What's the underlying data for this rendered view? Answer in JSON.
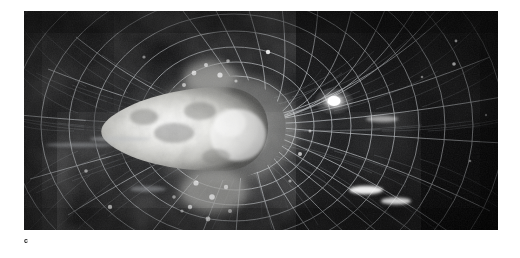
{
  "figure": {
    "panel_label": "c",
    "caption_text": "",
    "kind": "scientific-image"
  },
  "image": {
    "name": "spherical-projection-grid-image",
    "description": "Grayscale wide-field image showing a bright textured central core with radial meridian lines and concentric arc rings forming a spherical tunnel projection over a dark background with bright point sources and elongated streaks.",
    "colors": {
      "page_background": "#ffffff",
      "plate_background": "#050505",
      "plate_deep_black": "#000000",
      "grid_line": "#b9bcc0",
      "grid_line_faint": "#5a5e63",
      "core_bright": "#f2f2ef",
      "core_mid": "#c8c8c4",
      "core_shadow": "#8d8d8a",
      "star_white": "#ffffff",
      "nebula_grey": "#3a3c3e",
      "label_text": "#1a1a1a"
    },
    "geometry": {
      "plate_left": 24,
      "plate_top": 11,
      "plate_width": 474,
      "plate_height": 219,
      "vanishing_point_x": 236,
      "vanishing_point_y": 126,
      "core_center_x": 222,
      "core_center_y": 128,
      "core_radius_x": 42,
      "core_radius_y": 38,
      "meridian_count": 28,
      "ring_count": 16,
      "latitude_tick_count": 120
    },
    "bright_sources": [
      {
        "name": "point-source-upper-right",
        "x": 334,
        "y": 101,
        "rx": 9,
        "ry": 6,
        "intensity": 1.0
      },
      {
        "name": "streak-right-upper",
        "x": 382,
        "y": 119,
        "rx": 13,
        "ry": 3,
        "intensity": 0.55
      },
      {
        "name": "streak-lower-right-a",
        "x": 366,
        "y": 190,
        "rx": 15,
        "ry": 4,
        "intensity": 0.95
      },
      {
        "name": "streak-lower-right-b",
        "x": 396,
        "y": 201,
        "rx": 13,
        "ry": 3.5,
        "intensity": 0.8
      },
      {
        "name": "point-source-top-center",
        "x": 268,
        "y": 52,
        "rx": 3,
        "ry": 3,
        "intensity": 0.7
      },
      {
        "name": "point-source-right-mid",
        "x": 300,
        "y": 154,
        "rx": 3,
        "ry": 2.5,
        "intensity": 0.6
      },
      {
        "name": "point-source-left-arm",
        "x": 112,
        "y": 138,
        "rx": 5,
        "ry": 3,
        "intensity": 0.5
      },
      {
        "name": "point-source-lower-left",
        "x": 88,
        "y": 198,
        "rx": 4,
        "ry": 3,
        "intensity": 0.45
      },
      {
        "name": "point-source-far-right",
        "x": 454,
        "y": 64,
        "rx": 3,
        "ry": 5,
        "intensity": 0.4
      }
    ]
  }
}
